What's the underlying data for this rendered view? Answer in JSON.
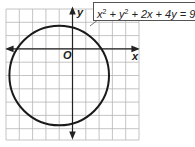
{
  "diagram": {
    "type": "circle-graph",
    "equation": {
      "text": "x^2 + y^2 + 2x + 4y = 9",
      "parts": [
        "x",
        "2",
        " + y",
        "2",
        " + 2x + 4y = 9"
      ]
    },
    "axes": {
      "x_label": "x",
      "y_label": "y",
      "origin_label": "O"
    },
    "grid": {
      "x_range": [
        -5,
        5
      ],
      "y_range": [
        -7,
        3
      ],
      "cell_px": 13.3
    },
    "circle": {
      "center": [
        -1,
        -2
      ],
      "radius": 3.74
    },
    "colors": {
      "grid": "#b5b5b5",
      "axis": "#222222",
      "circle": "#1a1a1a",
      "box_border": "#555555"
    }
  }
}
